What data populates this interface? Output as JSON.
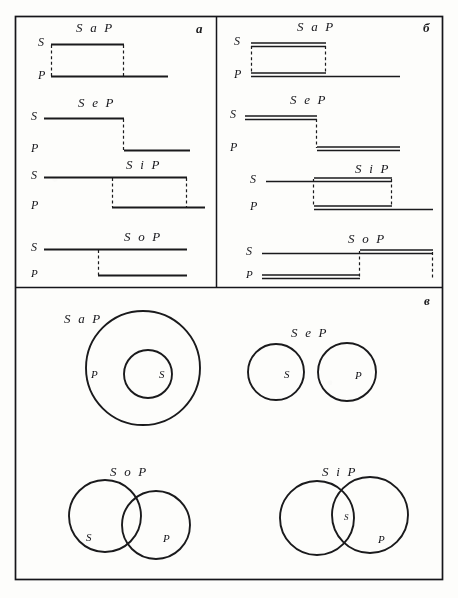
{
  "figure": {
    "panels": [
      {
        "id": "a",
        "letter": "а"
      },
      {
        "id": "b",
        "letter": "б"
      },
      {
        "id": "v",
        "letter": "в"
      }
    ],
    "panel_a": {
      "rows": [
        {
          "title": "S a P",
          "subject_label": "S",
          "predicate_label": "P"
        },
        {
          "title": "S e P",
          "subject_label": "S",
          "predicate_label": "P"
        },
        {
          "title": "S i P",
          "subject_label": "S",
          "predicate_label": "P"
        },
        {
          "title": "S o P",
          "subject_label": "S",
          "predicate_label": "P"
        }
      ]
    },
    "panel_b": {
      "rows": [
        {
          "title": "S a P",
          "subject_label": "S",
          "predicate_label": "P"
        },
        {
          "title": "S e P",
          "subject_label": "S",
          "predicate_label": "P"
        },
        {
          "title": "S i P",
          "subject_label": "S",
          "predicate_label": "P"
        },
        {
          "title": "S o P",
          "subject_label": "S",
          "predicate_label": "P"
        }
      ]
    },
    "panel_v": {
      "diagrams": [
        {
          "title": "S a P",
          "inner_label": "S",
          "outer_label": "P",
          "kind": "containment"
        },
        {
          "title": "S e P",
          "left_label": "S",
          "right_label": "P",
          "kind": "disjoint"
        },
        {
          "title": "S o P",
          "left_label": "S",
          "right_label": "P",
          "kind": "overlap"
        },
        {
          "title": "S i P",
          "left_label": "S",
          "right_label": "P",
          "overlap_label": "S",
          "kind": "overlap"
        }
      ]
    },
    "ink_color": "#16161a"
  }
}
